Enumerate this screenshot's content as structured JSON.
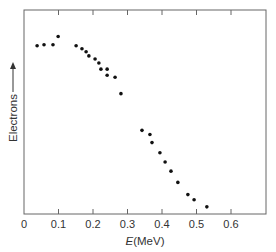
{
  "chart_data": {
    "type": "scatter",
    "title": "",
    "xlabel_italic": "E",
    "xlabel_unit": "(MeV)",
    "xlabel": "E(MeV)",
    "ylabel": "Electrons",
    "ylabel_arrow": true,
    "xlim": [
      0,
      0.7
    ],
    "ylim": [
      0,
      100
    ],
    "x_ticks": [
      0,
      0.1,
      0.2,
      0.3,
      0.4,
      0.5,
      0.6
    ],
    "x_tick_labels": [
      "0",
      "0.1",
      "0.2",
      "0.3",
      "0.4",
      "0.5",
      "0.6"
    ],
    "y_ticks": [],
    "grid": false,
    "legend": null,
    "series": [
      {
        "name": "Electrons",
        "points": [
          {
            "x": 0.038,
            "y": 82.5
          },
          {
            "x": 0.058,
            "y": 83.0
          },
          {
            "x": 0.084,
            "y": 83.0
          },
          {
            "x": 0.099,
            "y": 87.0
          },
          {
            "x": 0.151,
            "y": 82.5
          },
          {
            "x": 0.168,
            "y": 81.0
          },
          {
            "x": 0.18,
            "y": 79.5
          },
          {
            "x": 0.188,
            "y": 77.5
          },
          {
            "x": 0.206,
            "y": 76.0
          },
          {
            "x": 0.217,
            "y": 74.0
          },
          {
            "x": 0.223,
            "y": 71.0
          },
          {
            "x": 0.241,
            "y": 71.0
          },
          {
            "x": 0.241,
            "y": 68.0
          },
          {
            "x": 0.264,
            "y": 67.0
          },
          {
            "x": 0.281,
            "y": 59.0
          },
          {
            "x": 0.342,
            "y": 41.0
          },
          {
            "x": 0.365,
            "y": 39.0
          },
          {
            "x": 0.371,
            "y": 35.0
          },
          {
            "x": 0.394,
            "y": 30.0
          },
          {
            "x": 0.409,
            "y": 25.5
          },
          {
            "x": 0.426,
            "y": 21.0
          },
          {
            "x": 0.446,
            "y": 15.5
          },
          {
            "x": 0.475,
            "y": 9.5
          },
          {
            "x": 0.493,
            "y": 7.0
          },
          {
            "x": 0.53,
            "y": 3.5
          }
        ]
      }
    ]
  }
}
